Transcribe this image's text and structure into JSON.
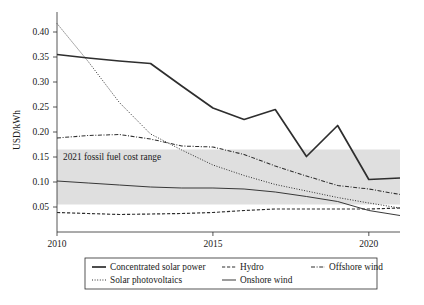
{
  "chart_data": {
    "type": "line",
    "title": "",
    "xlabel": "",
    "ylabel": "USD/kWh",
    "xlim": [
      2010,
      2021
    ],
    "ylim": [
      0.0,
      0.44
    ],
    "x": [
      2010,
      2011,
      2012,
      2013,
      2014,
      2015,
      2016,
      2017,
      2018,
      2019,
      2020,
      2021
    ],
    "xticks": [
      "2010",
      "2015",
      "2020"
    ],
    "xtick_values": [
      2010,
      2015,
      2020
    ],
    "yticks": [
      "0.05",
      "0.10",
      "0.15",
      "0.20",
      "0.25",
      "0.30",
      "0.35",
      "0.40"
    ],
    "ytick_values": [
      0.05,
      0.1,
      0.15,
      0.2,
      0.25,
      0.3,
      0.35,
      0.4
    ],
    "grid": false,
    "legend_position": "below-axes",
    "series": [
      {
        "name": "Concentrated solar power",
        "style": "solid-thick",
        "values": [
          0.355,
          0.348,
          0.342,
          0.337,
          0.292,
          0.248,
          0.225,
          0.245,
          0.151,
          0.213,
          0.105,
          0.108
        ]
      },
      {
        "name": "Solar photovoltaics",
        "style": "dotted",
        "values": [
          0.417,
          0.341,
          0.259,
          0.196,
          0.164,
          0.134,
          0.113,
          0.095,
          0.082,
          0.069,
          0.058,
          0.048
        ]
      },
      {
        "name": "Hydro",
        "style": "dashed",
        "values": [
          0.039,
          0.037,
          0.035,
          0.036,
          0.037,
          0.039,
          0.043,
          0.046,
          0.046,
          0.046,
          0.046,
          0.048
        ]
      },
      {
        "name": "Onshore wind",
        "style": "solid-thin",
        "values": [
          0.102,
          0.098,
          0.094,
          0.09,
          0.088,
          0.088,
          0.086,
          0.08,
          0.071,
          0.061,
          0.043,
          0.033
        ]
      },
      {
        "name": "Offshore wind",
        "style": "dash-dot",
        "values": [
          0.188,
          0.193,
          0.195,
          0.186,
          0.172,
          0.17,
          0.155,
          0.132,
          0.112,
          0.093,
          0.086,
          0.075
        ]
      }
    ],
    "annotations": [
      {
        "name": "fossil-fuel-band",
        "label": "2021 fossil fuel cost range",
        "type": "hband",
        "y_low": 0.055,
        "y_high": 0.165,
        "color": "#d9d9d9"
      }
    ]
  },
  "legend": {
    "entries": [
      {
        "label": "Concentrated solar power",
        "style": "solid-thick"
      },
      {
        "label": "Solar photovoltaics",
        "style": "dotted"
      },
      {
        "label": "Hydro",
        "style": "dashed"
      },
      {
        "label": "Onshore wind",
        "style": "solid-thin"
      },
      {
        "label": "Offshore wind",
        "style": "dash-dot"
      }
    ]
  },
  "caption": {
    "text": ""
  }
}
